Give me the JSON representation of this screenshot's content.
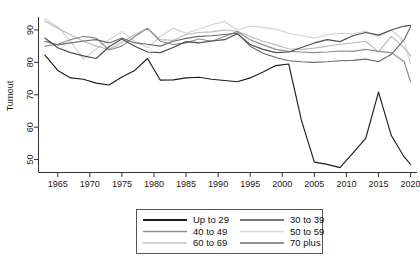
{
  "chart_data": {
    "type": "line",
    "title": "",
    "xlabel": "",
    "ylabel": "Turnout",
    "xlim": [
      1962,
      2021
    ],
    "ylim": [
      46,
      94
    ],
    "grid": false,
    "legend_position": "bottom-center",
    "xticks": [
      1965,
      1970,
      1975,
      1980,
      1985,
      1990,
      1995,
      2000,
      2005,
      2010,
      2015,
      2020
    ],
    "yticks": [
      50,
      60,
      70,
      80,
      90
    ],
    "x": [
      1963,
      1965,
      1967,
      1969,
      1971,
      1973,
      1975,
      1977,
      1979,
      1981,
      1983,
      1985,
      1987,
      1989,
      1991,
      1993,
      1995,
      1997,
      1999,
      2001,
      2003,
      2005,
      2007,
      2009,
      2011,
      2013,
      2015,
      2017,
      2019,
      2020
    ],
    "series": [
      {
        "name": "Up to 29",
        "color": "#1c1c1c",
        "values": [
          82.2,
          77.5,
          75.2,
          74.8,
          73.6,
          73.0,
          75.5,
          77.5,
          81.2,
          74.5,
          74.6,
          75.2,
          75.4,
          74.8,
          74.4,
          74.0,
          75.2,
          77.0,
          79.0,
          79.5,
          62.0,
          49.2,
          48.5,
          47.5,
          52.0,
          56.5,
          70.8,
          57.4,
          50.8,
          48.5
        ]
      },
      {
        "name": "30 to 39",
        "color": "#4d4d4d",
        "values": [
          87.5,
          84.5,
          83.0,
          82.0,
          81.2,
          84.8,
          87.2,
          85.0,
          83.2,
          83.0,
          84.6,
          86.4,
          86.0,
          86.6,
          87.0,
          88.8,
          85.5,
          84.0,
          83.0,
          83.2,
          84.6,
          86.0,
          87.0,
          86.4,
          88.2,
          89.2,
          88.4,
          90.0,
          91.2,
          91.4
        ]
      },
      {
        "name": "40 to 49",
        "color": "#8c8c8c",
        "values": [
          85.0,
          85.6,
          87.0,
          88.0,
          87.5,
          83.8,
          85.0,
          88.0,
          90.5,
          86.5,
          85.5,
          86.0,
          87.2,
          86.5,
          88.0,
          89.5,
          87.0,
          85.4,
          84.0,
          83.4,
          83.2,
          83.0,
          83.2,
          83.5,
          83.4,
          84.0,
          83.4,
          83.0,
          80.2,
          74.0
        ]
      },
      {
        "name": "50 to 59",
        "color": "#d2d2d2",
        "values": [
          93.5,
          91.0,
          86.5,
          81.0,
          84.2,
          87.0,
          89.5,
          86.5,
          84.5,
          88.0,
          90.5,
          89.0,
          90.2,
          91.6,
          92.6,
          90.0,
          91.2,
          90.8,
          90.2,
          89.0,
          88.2,
          87.5,
          88.5,
          89.0,
          88.8,
          89.6,
          88.0,
          90.0,
          86.5,
          79.5
        ]
      },
      {
        "name": "60 to 69",
        "color": "#bcbcbc",
        "values": [
          92.8,
          90.5,
          88.5,
          86.5,
          85.0,
          84.0,
          86.2,
          88.5,
          90.5,
          87.0,
          86.8,
          88.6,
          89.2,
          89.4,
          90.0,
          89.6,
          88.0,
          86.5,
          85.4,
          84.2,
          84.0,
          84.4,
          85.0,
          85.6,
          86.0,
          86.5,
          83.2,
          88.0,
          84.5,
          82.0
        ]
      },
      {
        "name": "70 plus",
        "color": "#6b6b6b",
        "values": [
          86.5,
          85.4,
          86.0,
          86.6,
          87.0,
          86.0,
          87.5,
          86.0,
          85.6,
          85.0,
          86.5,
          87.4,
          88.0,
          88.2,
          88.6,
          89.0,
          85.0,
          82.8,
          81.5,
          80.5,
          80.2,
          80.0,
          80.2,
          80.5,
          80.6,
          81.0,
          80.2,
          82.5,
          87.0,
          91.0
        ]
      }
    ]
  },
  "legend": {
    "entries": [
      {
        "label": "Up to 29",
        "color": "#1c1c1c"
      },
      {
        "label": "30 to 39",
        "color": "#4d4d4d"
      },
      {
        "label": "40 to 49",
        "color": "#8c8c8c"
      },
      {
        "label": "50 to 59",
        "color": "#d8d8d8"
      },
      {
        "label": "60 to 69",
        "color": "#c4c4c4"
      },
      {
        "label": "70 plus",
        "color": "#6b6b6b"
      }
    ]
  },
  "axes": {
    "y_label": "Turnout",
    "y_ticks": [
      "50",
      "60",
      "70",
      "80",
      "90"
    ],
    "x_ticks": [
      "1965",
      "1970",
      "1975",
      "1980",
      "1985",
      "1990",
      "1995",
      "2000",
      "2005",
      "2010",
      "2015",
      "2020"
    ]
  }
}
